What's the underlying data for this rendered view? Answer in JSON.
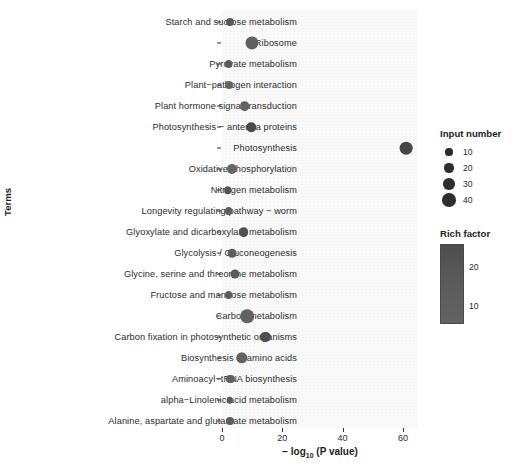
{
  "chart_data": {
    "type": "scatter",
    "title": "",
    "xlabel": "− log10 (P value)",
    "xlabel_prefix": "− log",
    "xlabel_sub": "10",
    "xlabel_suffix": " (P value)",
    "ylabel": "Terms",
    "xlim": [
      -4,
      65
    ],
    "xticks": [
      0,
      20,
      40,
      60
    ],
    "xticklabels": [
      "0",
      "20",
      "40",
      "60"
    ],
    "grid": false,
    "categories": [
      "Starch and sucrose metabolism",
      "Ribosome",
      "Pyruvate metabolism",
      "Plant−pathogen interaction",
      "Plant hormone signal transduction",
      "Photosynthesis − antenna proteins",
      "Photosynthesis",
      "Oxidative phosphorylation",
      "Nitrogen metabolism",
      "Longevity regulating pathway − worm",
      "Glyoxylate and dicarboxylate metabolism",
      "Glycolysis / Gluconeogenesis",
      "Glycine, serine and threonine metabolism",
      "Fructose and mannose metabolism",
      "Carbon metabolism",
      "Carbon fixation in photosynthetic organisms",
      "Biosynthesis of amino acids",
      "Aminoacyl−tRNA biosynthesis",
      "alpha−Linolenic acid metabolism",
      "Alanine, aspartate and glutamate metabolism"
    ],
    "points": [
      {
        "term": "Starch and sucrose metabolism",
        "x": 2.5,
        "input_number": 14,
        "rich_factor": 17
      },
      {
        "term": "Ribosome",
        "x": 10.0,
        "input_number": 38,
        "rich_factor": 14
      },
      {
        "term": "Pyruvate metabolism",
        "x": 2.2,
        "input_number": 13,
        "rich_factor": 17
      },
      {
        "term": "Plant−pathogen interaction",
        "x": 2.2,
        "input_number": 14,
        "rich_factor": 12
      },
      {
        "term": "Plant hormone signal transduction",
        "x": 7.5,
        "input_number": 22,
        "rich_factor": 13
      },
      {
        "term": "Photosynthesis − antenna proteins",
        "x": 9.7,
        "input_number": 21,
        "rich_factor": 24
      },
      {
        "term": "Photosynthesis",
        "x": 61.0,
        "input_number": 36,
        "rich_factor": 26
      },
      {
        "term": "Oxidative phosphorylation",
        "x": 3.4,
        "input_number": 24,
        "rich_factor": 11
      },
      {
        "term": "Nitrogen metabolism",
        "x": 1.9,
        "input_number": 12,
        "rich_factor": 19
      },
      {
        "term": "Longevity regulating pathway − worm",
        "x": 2.2,
        "input_number": 13,
        "rich_factor": 15
      },
      {
        "term": "Glyoxylate and dicarboxylate metabolism",
        "x": 7.2,
        "input_number": 22,
        "rich_factor": 21
      },
      {
        "term": "Glycolysis / Gluconeogenesis",
        "x": 3.4,
        "input_number": 17,
        "rich_factor": 14
      },
      {
        "term": "Glycine, serine and threonine metabolism",
        "x": 4.4,
        "input_number": 19,
        "rich_factor": 16
      },
      {
        "term": "Fructose and mannose metabolism",
        "x": 2.2,
        "input_number": 13,
        "rich_factor": 15
      },
      {
        "term": "Carbon metabolism",
        "x": 8.4,
        "input_number": 40,
        "rich_factor": 13
      },
      {
        "term": "Carbon fixation in photosynthetic organisms",
        "x": 14.4,
        "input_number": 24,
        "rich_factor": 22
      },
      {
        "term": "Biosynthesis of amino acids",
        "x": 6.6,
        "input_number": 30,
        "rich_factor": 13
      },
      {
        "term": "Aminoacyl−tRNA biosynthesis",
        "x": 2.8,
        "input_number": 15,
        "rich_factor": 14
      },
      {
        "term": "alpha−Linolenic acid metabolism",
        "x": 2.5,
        "input_number": 8,
        "rich_factor": 16
      },
      {
        "term": "Alanine, aspartate and glutamate metabolism",
        "x": 2.5,
        "input_number": 14,
        "rich_factor": 15
      }
    ],
    "legends": {
      "size": {
        "title": "Input number",
        "position": "right-top",
        "entries": [
          {
            "label": "10",
            "value": 10
          },
          {
            "label": "20",
            "value": 20
          },
          {
            "label": "30",
            "value": 30
          },
          {
            "label": "40",
            "value": 40
          }
        ]
      },
      "color": {
        "title": "Rich factor",
        "position": "right-bottom",
        "ticks": [
          {
            "label": "20",
            "value": 20
          },
          {
            "label": "10",
            "value": 10
          }
        ],
        "colorbar_high": "#4e4e4e",
        "colorbar_low": "#636363"
      }
    },
    "colors": {
      "dot": "#4d4d4d",
      "text": "#2b2b2b",
      "axis": "#333333",
      "panel_background": "#fafafa"
    }
  }
}
